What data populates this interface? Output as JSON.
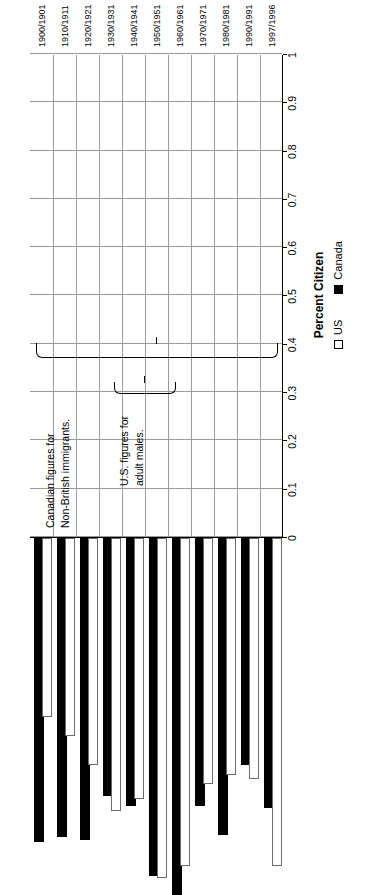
{
  "chart_data": {
    "type": "bar",
    "orientation": "horizontal",
    "title": "",
    "xlabel": "Percent Citizen",
    "ylabel": "",
    "categories": [
      "1900/1901",
      "1910/1911",
      "1920/1921",
      "1930/1931",
      "1940/1941",
      "1950/1951",
      "1960/1961",
      "1970/1971",
      "1980/1981",
      "1990/1991",
      "1997/1996"
    ],
    "series": [
      {
        "name": "US",
        "color": "#ffffff",
        "values": [
          0.68,
          0.5,
          0.49,
          0.51,
          0.68,
          0.705,
          0.54,
          0.565,
          0.47,
          0.41,
          0.37
        ]
      },
      {
        "name": "Canada",
        "color": "#000000",
        "values": [
          0.56,
          0.47,
          0.615,
          0.555,
          0.74,
          0.7,
          0.555,
          0.535,
          0.625,
          0.62,
          0.63
        ]
      }
    ],
    "xlim": [
      0,
      1
    ],
    "xticks": [
      "0",
      "0.1",
      "0.2",
      "0.3",
      "0.4",
      "0.5",
      "0.6",
      "0.7",
      "0.8",
      "0.9",
      "1"
    ],
    "grid": true,
    "legend_position": "bottom",
    "annotations": [
      {
        "id": "canada-note",
        "text": [
          "Canadian figures for",
          "Non-British immigrants."
        ]
      },
      {
        "id": "us-note",
        "text": [
          "U.S. figures for",
          "adult males."
        ]
      }
    ]
  },
  "legend": {
    "us_label": "US",
    "canada_label": "Canada"
  }
}
